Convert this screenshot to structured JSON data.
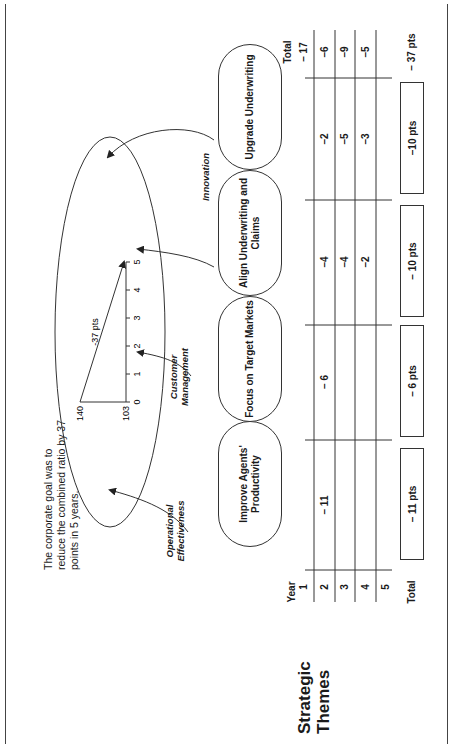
{
  "title": "Strategic Themes",
  "goal_note": "The corporate goal was to reduce the combined ratio by 37 points in 5 years.",
  "goal_chart": {
    "start_value": "140",
    "end_value": "103",
    "change_label": "-37 pts",
    "x_ticks": [
      "0",
      "1",
      "2",
      "3",
      "4",
      "5"
    ]
  },
  "themes": [
    {
      "label": "Operational Effectiveness"
    },
    {
      "label": "Customer Management"
    },
    {
      "label": "Innovation"
    }
  ],
  "objectives": [
    {
      "label": "Improve Agents' Productivity",
      "values": [
        "",
        "– 11",
        "",
        "",
        ""
      ],
      "total": "– 11 pts"
    },
    {
      "label": "Focus on Target Markets",
      "values": [
        "",
        "– 6",
        "",
        "",
        ""
      ],
      "total": "– 6 pts"
    },
    {
      "label": "Align Underwriting and Claims",
      "values": [
        "",
        "–4",
        "–4",
        "–2",
        ""
      ],
      "total": "– 10 pts"
    },
    {
      "label": "Upgrade Underwriting",
      "values": [
        "",
        "–2",
        "–5",
        "–3",
        ""
      ],
      "total": "–10 pts"
    }
  ],
  "table": {
    "year_header": "Year",
    "total_header": "Total",
    "years": [
      "1",
      "2",
      "3",
      "4",
      "5"
    ],
    "row_label_total": "Total",
    "row_totals": [
      "– 17",
      "–6",
      "–9",
      "–5",
      ""
    ],
    "grand_total": "– 37 pts"
  },
  "chart_data": {
    "type": "line",
    "title": "",
    "xlabel": "",
    "ylabel": "",
    "x": [
      0,
      5
    ],
    "y": [
      140,
      103
    ],
    "annotations": [
      "-37 pts"
    ],
    "x_ticks": [
      0,
      1,
      2,
      3,
      4,
      5
    ],
    "y_ticks": [
      140,
      103
    ]
  }
}
